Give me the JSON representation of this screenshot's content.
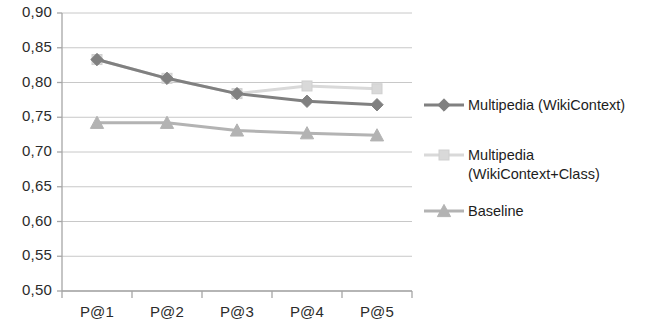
{
  "chart_data": {
    "type": "line",
    "title": "",
    "subtitle": "",
    "xlabel": "",
    "ylabel": "",
    "categories": [
      "P@1",
      "P@2",
      "P@3",
      "P@4",
      "P@5"
    ],
    "ylim": [
      0.5,
      0.9
    ],
    "ytick_labels": [
      "0,90",
      "0,85",
      "0,80",
      "0,75",
      "0,70",
      "0,65",
      "0,60",
      "0,55",
      "0,50"
    ],
    "ytick_values": [
      0.9,
      0.85,
      0.8,
      0.75,
      0.7,
      0.65,
      0.6,
      0.55,
      0.5
    ],
    "grid": true,
    "legend_position": "right",
    "series": [
      {
        "name": "Multipedia (WikiContext)",
        "marker": "diamond",
        "color": "#808080",
        "values": [
          0.833,
          0.806,
          0.784,
          0.773,
          0.768
        ]
      },
      {
        "name": "Multipedia (WikiContext+Class)",
        "marker": "square",
        "color": "#d9d9d9",
        "values": [
          0.833,
          0.806,
          0.784,
          0.795,
          0.791
        ]
      },
      {
        "name": "Baseline",
        "marker": "triangle",
        "color": "#b3b3b3",
        "values": [
          0.742,
          0.742,
          0.731,
          0.727,
          0.724
        ]
      }
    ]
  },
  "legend": {
    "items": [
      {
        "label": "Multipedia (WikiContext)",
        "marker": "diamond-marker",
        "color": "#808080"
      },
      {
        "label": "Multipedia\n(WikiContext+Class)",
        "marker": "square-marker",
        "color": "#d9d9d9"
      },
      {
        "label": "Baseline",
        "marker": "triangle-marker",
        "color": "#b3b3b3"
      }
    ]
  },
  "axes": {
    "grid_color": "#c8c8c8",
    "axis_color": "#a6a6a6"
  }
}
